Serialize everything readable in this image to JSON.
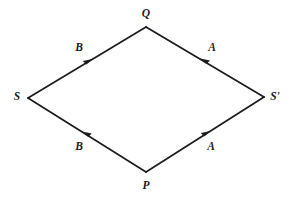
{
  "figure": {
    "background_color": "#ffffff",
    "stroke_color": "#1c1c1c",
    "label_color": "#1c1c1c",
    "canvas": {
      "width": 289,
      "height": 198
    }
  },
  "vertices": [
    {
      "id": "Q",
      "label": "Q",
      "x": 146,
      "y": 27,
      "label_x": 146,
      "label_y": 14
    },
    {
      "id": "S",
      "label": "S",
      "x": 28,
      "y": 98,
      "label_x": 17,
      "label_y": 97
    },
    {
      "id": "Sp",
      "label": "S'",
      "x": 264,
      "y": 97,
      "label_x": 275,
      "label_y": 97
    },
    {
      "id": "P",
      "label": "P",
      "x": 146,
      "y": 172,
      "label_x": 146,
      "label_y": 186
    }
  ],
  "edges": [
    {
      "id": "edge-S-Q",
      "label": "B",
      "from": "S",
      "to": "Q",
      "x1": 28,
      "y1": 98,
      "x2": 146,
      "y2": 27,
      "arrow_x": 89,
      "arrow_y": 61,
      "arrow_direction": "up-right",
      "label_x": 79,
      "label_y": 48
    },
    {
      "id": "edge-Sp-Q",
      "label": "A",
      "from": "Sp",
      "to": "Q",
      "x1": 264,
      "y1": 97,
      "x2": 146,
      "y2": 27,
      "arrow_x": 204,
      "arrow_y": 61,
      "arrow_direction": "up-left",
      "label_x": 212,
      "label_y": 48
    },
    {
      "id": "edge-P-S",
      "label": "B",
      "from": "P",
      "to": "S",
      "x1": 146,
      "y1": 172,
      "x2": 28,
      "y2": 98,
      "arrow_x": 86,
      "arrow_y": 134,
      "arrow_direction": "up-left",
      "label_x": 79,
      "label_y": 147
    },
    {
      "id": "edge-P-Sp",
      "label": "A",
      "from": "P",
      "to": "Sp",
      "x1": 146,
      "y1": 172,
      "x2": 264,
      "y2": 97,
      "arrow_x": 206,
      "arrow_y": 134,
      "arrow_direction": "up-right",
      "label_x": 211,
      "label_y": 147
    }
  ]
}
